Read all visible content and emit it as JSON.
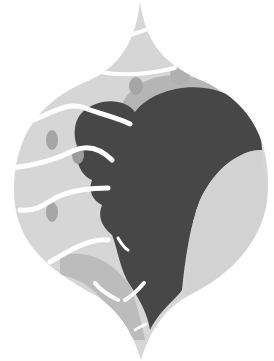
{
  "illustration": {
    "subject": "abstract onion-dome shape with dark profile silhouette and white wavy lines",
    "colors": {
      "background": "#ffffff",
      "dome_light": "#d9d9d9",
      "dome_mid": "#bdbdbd",
      "silhouette": "#4a4a4a",
      "spots": "#a8a8a8",
      "right_lobe": "#d4d4d4",
      "waves": "#ffffff"
    }
  }
}
